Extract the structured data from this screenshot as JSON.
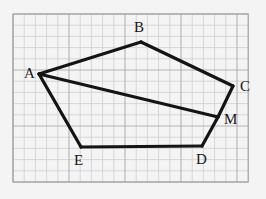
{
  "figure": {
    "background_color": "#f4f4f4",
    "grid": {
      "line_color": "#b3b3b5",
      "minor_line_color": "#d3d3d6",
      "cell_size_px": 11.2,
      "origin_x": 13,
      "origin_y": 14,
      "cols": 21,
      "rows": 15,
      "border_color": "#9a9a9d"
    },
    "stroke": {
      "color": "#141414",
      "width": 3.2
    },
    "points": [
      {
        "name": "A",
        "x": 39,
        "y": 74,
        "label": "A",
        "label_x": 24,
        "label_y": 66
      },
      {
        "name": "B",
        "x": 141,
        "y": 42,
        "label": "B",
        "label_x": 134,
        "label_y": 20
      },
      {
        "name": "C",
        "x": 233,
        "y": 86,
        "label": "C",
        "label_x": 240,
        "label_y": 79
      },
      {
        "name": "M",
        "x": 218,
        "y": 117,
        "label": "M",
        "label_x": 224,
        "label_y": 112
      },
      {
        "name": "D",
        "x": 202,
        "y": 146,
        "label": "D",
        "label_x": 196,
        "label_y": 152
      },
      {
        "name": "E",
        "x": 81,
        "y": 147,
        "label": "E",
        "label_x": 74,
        "label_y": 153
      }
    ],
    "segments": [
      {
        "name": "AB",
        "from": "A",
        "to": "B"
      },
      {
        "name": "BC",
        "from": "B",
        "to": "C"
      },
      {
        "name": "CM",
        "from": "C",
        "to": "M"
      },
      {
        "name": "MD",
        "from": "M",
        "to": "D"
      },
      {
        "name": "DE",
        "from": "D",
        "to": "E"
      },
      {
        "name": "EA",
        "from": "E",
        "to": "A"
      },
      {
        "name": "AM",
        "from": "A",
        "to": "M"
      }
    ]
  }
}
